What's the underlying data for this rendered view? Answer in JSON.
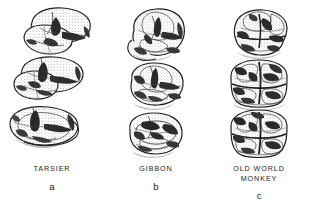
{
  "figure": {
    "background_color": "#ffffff",
    "ink_color": "#1a1a1a",
    "style": "stippled pen-and-ink scientific illustration",
    "panel_count": 3
  },
  "panels": [
    {
      "id": "tarsier",
      "common_name": "TARSIER",
      "letter": "a",
      "tooth_count": 3,
      "arrangement": "oblique staggered row, crowns broad and low with sharp crests",
      "description": "Three molars stepped diagonally; each crown roughly rectangular with a deep central basin and dark shaded grooves."
    },
    {
      "id": "gibbon",
      "common_name": "GIBBON",
      "letter": "b",
      "tooth_count": 3,
      "arrangement": "vertical row, rounded bunodont crowns",
      "description": "Three molars stacked vertically; rounded cusps with Y-shaped fissure pattern and dark interstitial shading."
    },
    {
      "id": "old-world-monkey",
      "common_name": "OLD WORLD\nMONKEY",
      "letter": "c",
      "tooth_count": 3,
      "arrangement": "vertical row, bilophodont crowns",
      "description": "Three molars stacked vertically; each shows two transverse ridges forming a cross-shaped fissure pattern with heavy dark shading."
    }
  ]
}
